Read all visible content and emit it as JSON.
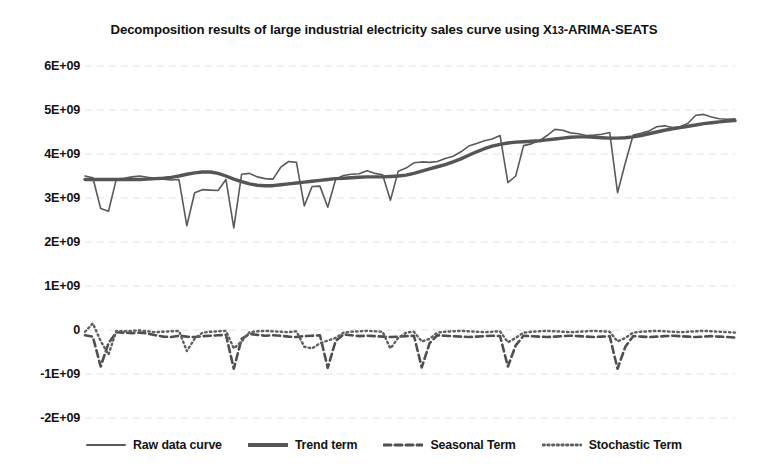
{
  "chart_data": {
    "type": "line",
    "title": "Decomposition results of large industrial electricity sales curve using X13-ARIMA-SEATS",
    "title_main": "Decomposition results of large industrial electricity sales curve using X",
    "title_sub": "13",
    "title_tail": "-ARIMA-SEATS",
    "xlabel": "",
    "ylabel": "",
    "ylim": [
      -2000000000,
      6000000000
    ],
    "grid": true,
    "legend_position": "bottom",
    "yticks": [
      {
        "value": 6000000000,
        "label": "6E+09"
      },
      {
        "value": 5000000000,
        "label": "5E+09"
      },
      {
        "value": 4000000000,
        "label": "4E+09"
      },
      {
        "value": 3000000000,
        "label": "3E+09"
      },
      {
        "value": 2000000000,
        "label": "2E+09"
      },
      {
        "value": 1000000000,
        "label": "1E+09"
      },
      {
        "value": 0,
        "label": "0"
      },
      {
        "value": -1000000000,
        "label": "-1E+09"
      },
      {
        "value": -2000000000,
        "label": "-2E+09"
      }
    ],
    "xticks": [],
    "x_count": 84,
    "colors": {
      "raw": "#5a5a5a",
      "trend": "#555555",
      "seasonal": "#4f4f4f",
      "stochastic": "#606060",
      "grid": "#e2e2e2",
      "text": "#131313"
    },
    "series": [
      {
        "name": "Raw data curve",
        "style": "solid-thin",
        "values": [
          3500000000,
          3460000000,
          2760000000,
          2700000000,
          3430000000,
          3450000000,
          3480000000,
          3500000000,
          3470000000,
          3450000000,
          3430000000,
          3410000000,
          3420000000,
          2370000000,
          3120000000,
          3190000000,
          3180000000,
          3170000000,
          3420000000,
          2320000000,
          3540000000,
          3560000000,
          3480000000,
          3440000000,
          3430000000,
          3700000000,
          3830000000,
          3810000000,
          2820000000,
          3260000000,
          3270000000,
          2790000000,
          3420000000,
          3510000000,
          3540000000,
          3550000000,
          3620000000,
          3560000000,
          3530000000,
          2950000000,
          3610000000,
          3680000000,
          3800000000,
          3820000000,
          3810000000,
          3830000000,
          3900000000,
          3950000000,
          4050000000,
          4180000000,
          4240000000,
          4300000000,
          4340000000,
          4420000000,
          3350000000,
          3500000000,
          4190000000,
          4230000000,
          4300000000,
          4420000000,
          4560000000,
          4540000000,
          4480000000,
          4460000000,
          4420000000,
          4430000000,
          4450000000,
          4490000000,
          3120000000,
          3800000000,
          4430000000,
          4470000000,
          4520000000,
          4620000000,
          4640000000,
          4600000000,
          4620000000,
          4700000000,
          4880000000,
          4900000000,
          4840000000,
          4800000000,
          4790000000,
          4800000000
        ]
      },
      {
        "name": "Trend term",
        "style": "solid-thick",
        "values": [
          3420000000,
          3420000000,
          3420000000,
          3420000000,
          3420000000,
          3420000000,
          3420000000,
          3420000000,
          3430000000,
          3440000000,
          3450000000,
          3470000000,
          3500000000,
          3540000000,
          3570000000,
          3590000000,
          3590000000,
          3560000000,
          3500000000,
          3430000000,
          3370000000,
          3320000000,
          3290000000,
          3280000000,
          3280000000,
          3300000000,
          3320000000,
          3340000000,
          3360000000,
          3380000000,
          3400000000,
          3420000000,
          3440000000,
          3450000000,
          3460000000,
          3470000000,
          3480000000,
          3480000000,
          3480000000,
          3490000000,
          3500000000,
          3520000000,
          3560000000,
          3610000000,
          3660000000,
          3710000000,
          3760000000,
          3820000000,
          3890000000,
          3970000000,
          4050000000,
          4120000000,
          4180000000,
          4220000000,
          4250000000,
          4270000000,
          4280000000,
          4290000000,
          4300000000,
          4320000000,
          4340000000,
          4360000000,
          4380000000,
          4390000000,
          4390000000,
          4380000000,
          4370000000,
          4360000000,
          4360000000,
          4370000000,
          4390000000,
          4420000000,
          4460000000,
          4500000000,
          4540000000,
          4570000000,
          4600000000,
          4630000000,
          4660000000,
          4690000000,
          4710000000,
          4730000000,
          4750000000,
          4760000000
        ]
      },
      {
        "name": "Seasonal Term",
        "style": "dashed",
        "values": [
          -120000000,
          -150000000,
          -830000000,
          -300000000,
          -50000000,
          -60000000,
          -70000000,
          -60000000,
          -80000000,
          -120000000,
          -150000000,
          -160000000,
          -130000000,
          -150000000,
          -160000000,
          -140000000,
          -130000000,
          -120000000,
          -110000000,
          -880000000,
          -200000000,
          -90000000,
          -110000000,
          -130000000,
          -120000000,
          -130000000,
          -150000000,
          -160000000,
          -140000000,
          -130000000,
          -120000000,
          -860000000,
          -250000000,
          -100000000,
          -120000000,
          -140000000,
          -130000000,
          -140000000,
          -150000000,
          -160000000,
          -150000000,
          -140000000,
          -130000000,
          -850000000,
          -300000000,
          -120000000,
          -130000000,
          -140000000,
          -150000000,
          -160000000,
          -150000000,
          -140000000,
          -130000000,
          -140000000,
          -830000000,
          -350000000,
          -130000000,
          -140000000,
          -150000000,
          -160000000,
          -150000000,
          -140000000,
          -130000000,
          -140000000,
          -150000000,
          -160000000,
          -150000000,
          -140000000,
          -880000000,
          -380000000,
          -140000000,
          -150000000,
          -160000000,
          -150000000,
          -140000000,
          -130000000,
          -140000000,
          -150000000,
          -160000000,
          -150000000,
          -140000000,
          -150000000,
          -160000000,
          -170000000
        ]
      },
      {
        "name": "Stochastic Term",
        "style": "dotted",
        "values": [
          -40000000,
          150000000,
          -250000000,
          -560000000,
          -20000000,
          -30000000,
          -20000000,
          -10000000,
          -30000000,
          -50000000,
          -40000000,
          -30000000,
          -20000000,
          -480000000,
          -200000000,
          -60000000,
          -40000000,
          -30000000,
          -20000000,
          -420000000,
          -260000000,
          -50000000,
          -30000000,
          -20000000,
          -30000000,
          -40000000,
          -50000000,
          -30000000,
          -380000000,
          -420000000,
          -300000000,
          -240000000,
          -180000000,
          -60000000,
          -40000000,
          -30000000,
          -20000000,
          -30000000,
          -40000000,
          -420000000,
          -180000000,
          -60000000,
          -40000000,
          -260000000,
          -200000000,
          -60000000,
          -40000000,
          -30000000,
          -20000000,
          -30000000,
          -40000000,
          -50000000,
          -40000000,
          -30000000,
          -280000000,
          -180000000,
          -60000000,
          -40000000,
          -30000000,
          -20000000,
          -30000000,
          -40000000,
          -50000000,
          -40000000,
          -30000000,
          -20000000,
          -30000000,
          -40000000,
          -260000000,
          -180000000,
          -60000000,
          -40000000,
          -30000000,
          -20000000,
          -30000000,
          -40000000,
          -50000000,
          -40000000,
          -30000000,
          -20000000,
          -30000000,
          -40000000,
          -50000000,
          -60000000
        ]
      }
    ]
  },
  "legend": {
    "items": [
      {
        "label": "Raw data curve",
        "style": "solid-thin"
      },
      {
        "label": "Trend term",
        "style": "solid-thick"
      },
      {
        "label": "Seasonal Term",
        "style": "dashed"
      },
      {
        "label": "Stochastic Term",
        "style": "dotted"
      }
    ]
  }
}
